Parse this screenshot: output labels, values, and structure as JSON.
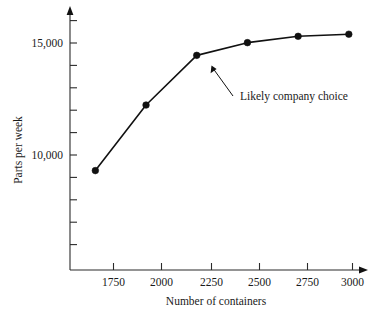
{
  "chart_data": {
    "type": "line",
    "title": "",
    "xlabel": "Number of containers",
    "ylabel": "Parts per week",
    "x": [
      1750,
      2000,
      2250,
      2500,
      2750,
      3000
    ],
    "values": [
      8700,
      11800,
      14150,
      14750,
      15050,
      15150
    ],
    "series": [
      {
        "name": "Parts per week",
        "values": [
          8700,
          11800,
          14150,
          14750,
          15050,
          15150
        ]
      }
    ],
    "xtick_labels": [
      "1750",
      "2000",
      "2250",
      "2500",
      "2750",
      "3000"
    ],
    "ytick_labels": [
      "10,000",
      "15,000"
    ],
    "ytick_values": [
      10000,
      15000
    ],
    "yticks_minor_step": 1000,
    "xlim": [
      1625,
      3065
    ],
    "ylim": [
      4000,
      16200
    ],
    "grid": false,
    "legend": "none",
    "marker": "filled-circle",
    "line_color": "#111111",
    "marker_color": "#111111",
    "axis_color": "#2b2b2b",
    "background": "#ffffff",
    "annotations": [
      {
        "text": "Likely company choice",
        "points_to_x": 2250,
        "points_to_y": 14150
      }
    ]
  },
  "axes": {
    "x_axis_name": "Number of containers",
    "y_axis_name": "Parts per week",
    "y_label_top": "15,000",
    "y_label_mid": "10,000",
    "x_tick_1": "1750",
    "x_tick_2": "2000",
    "x_tick_3": "2250",
    "x_tick_4": "2500",
    "x_tick_5": "2750",
    "x_tick_6": "3000"
  },
  "annotation": {
    "label": "Likely company choice"
  }
}
